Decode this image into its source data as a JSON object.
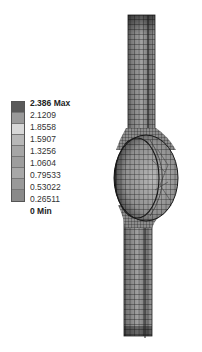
{
  "legend": {
    "labels": [
      "2.386 Max",
      "2.1209",
      "1.8558",
      "1.5907",
      "1.3256",
      "1.0604",
      "0.79533",
      "0.53022",
      "0.26511",
      "0 Min"
    ],
    "colors": [
      "#5a5a5a",
      "#9a9a9a",
      "#d8d8d8",
      "#b8b8b8",
      "#a6a6a6",
      "#9e9e9e",
      "#a8a8a8",
      "#999999",
      "#8a8a8a",
      "#4a4a4a"
    ]
  },
  "model": {
    "description": "grayscale FEA mesh contour of a vertical strip with a central elliptical bulb"
  }
}
